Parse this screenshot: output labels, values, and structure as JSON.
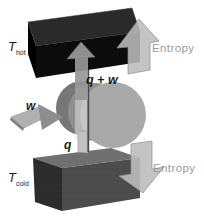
{
  "figure": {
    "background": "#ffffff",
    "labels": {
      "t_hot": {
        "main": "T",
        "sub": "hot"
      },
      "t_cold": {
        "main": "T",
        "sub": "cold"
      },
      "q_plus_w": "q + w",
      "q": "q",
      "w": "w",
      "entropy_top": "Entropy",
      "entropy_bottom": "Entropy"
    },
    "colors": {
      "hot_box_front": "#0c0c0c",
      "hot_box_top": "#2a2a2a",
      "hot_box_side": "#000000",
      "cold_box_front": "#4f4f4f",
      "cold_box_top": "#707070",
      "cold_box_side": "#2e2e2e",
      "entropy_arrow_fill": "#bcbcbc",
      "entropy_text": "#9a9a9a",
      "flow_arrow_fill": "#989898",
      "heat_strip_fill": "#c2c2c2",
      "work_arrow_fill": "#b0b0b0",
      "work_arrow_head": "#8e8e8e",
      "cylinder_back": "#777777",
      "cylinder_mid": "#8f8f8f",
      "cylinder_face": "#a9a9a9",
      "rod": "#4a4a4a",
      "label_text": "#1c1c1c"
    },
    "icons": {
      "entropy_up": "block-arrow-up",
      "entropy_down": "block-arrow-down",
      "heat_work_flow": "arrow-up",
      "work_input": "flat-arrow-right"
    }
  }
}
